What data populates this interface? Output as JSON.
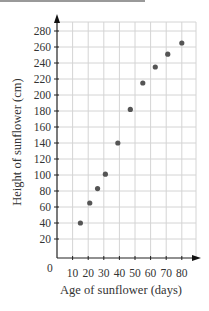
{
  "chart_data": {
    "type": "scatter",
    "title": "",
    "xlabel": "Age of sunflower (days)",
    "ylabel": "Height of sunflower (cm)",
    "origin_label": "0",
    "x_ticks": [
      10,
      20,
      30,
      40,
      50,
      60,
      70,
      80
    ],
    "y_ticks": [
      20,
      40,
      60,
      80,
      100,
      120,
      140,
      160,
      180,
      200,
      220,
      240,
      260,
      280
    ],
    "xlim": [
      0,
      85
    ],
    "ylim": [
      0,
      290
    ],
    "grid": true,
    "legend": null,
    "point_color": "#555555",
    "points": [
      {
        "x": 15,
        "y": 40
      },
      {
        "x": 21,
        "y": 65
      },
      {
        "x": 26,
        "y": 83
      },
      {
        "x": 31,
        "y": 101
      },
      {
        "x": 39,
        "y": 140
      },
      {
        "x": 47,
        "y": 182
      },
      {
        "x": 55,
        "y": 215
      },
      {
        "x": 63,
        "y": 235
      },
      {
        "x": 71,
        "y": 251
      },
      {
        "x": 80,
        "y": 265
      }
    ]
  }
}
